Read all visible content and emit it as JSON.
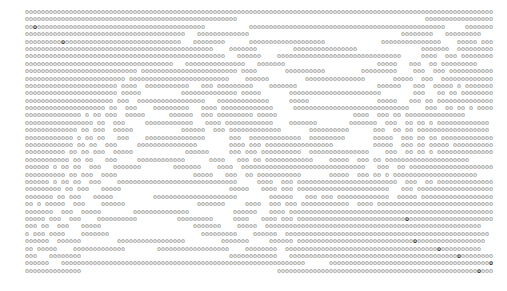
{
  "art": {
    "colors": {
      "glyph": "#7a7a7a",
      "highlight": "#1e1e1e",
      "background": "#ffffff"
    },
    "rows": [
      "ooooooooooooooooooooooooooooooooooooooooooooooooooooooooooooooooooooooooooooooooooooooooooooooooooooooooooooooooooooo",
      "ooooooooooooooooooooooooooooooooooooooooooooooooooooo                                               oooooooooooooooooooooo",
      "ooOoooooooooooooooooooooooooooooooooooooooooo           ooooooooooooooooooooooooooooooooooooooooooooooooo     ooooooooooooooo",
      "oooooooooooooooooooooooooooooooooooooooo   ooooooooooooo                                      oooooooo   ooooooooo",
      "oooooooooOooooooooooooooooooooooooooooo   oooooooo      ooooooooooooooooooo              ooooooooooooooo    ooooo oooooooo",
      "ooooooooooooooooooooooooooooooooooooooooooooooo    ooooooo         oooooooooooooooo                ooooooo  oooooooooooo",
      "ooooooooooooooooOooooooooooooooooooooooooooooooooooo     oooooooooo                    oooooooo     oooo ooo ooooooo",
      "oooooooooooooooooooooooooooooooooooooooooooooooooo   oooooo    ooooooooooooooooooooooooooooooo     oooo  ooo ooooooooo",
      "ooooooooooooooooooooooooooooooooooooo   ooooooooooooooo   ooooooo                       ooooo   ooo  oo ooooooooo",
      "oooooooooooooooooooooooooooo oooooooooooooooooooooooo oooo       oooooooooo         ooooooooo    ooo  ooo oooooooooooo",
      "ooooooooooooooooooooooooo ooooooooooooooooooooooooo    oooooo         ooooooooooooooo       ooooo  ooo  ooooooooooooo",
      "ooooooooooooooooooooooo oooo  ooooooooooo   ooo ooooooooo    ooooooo                    oooooo   ooo  ooooo o oooooooo",
      "ooooooooooooooooooooooo ooooo          oooooooooooooo ooooo       ooooooooooooooooooooooo        ooo   oo oo ooooooooooo",
      "oooooooooooooooooooooo ooo  ooooooooooooooooo   ooooooooooooo     ooooo                 ooooo   ooo oo oooooooooooooo",
      "oooooooooooooooooooo oo  ooo    ooooooooo   oooo ooooooooooooo     ooooooooooooooooooooooooooooo    ooo  oo oo o oooooooooooo",
      "oooooooooooooo o oo ooo  ooooo      oooooo  ooo ooooooooo ooooo                   oooo  ooo oo ooooooooooooooo",
      "ooooooooooooooooo oo  ooo     oooooooooooo   oooo oooooooooooo    ooooooo        ooooooo  ooo  oo oo o ooooooooooooo",
      "ooooooooooooo oo ooo  ooooo            oooooo  ooo ooooooooooooo       oooooooooo      ooo  oo oo oooooooooooooooooo",
      "oooooooooooo o oo oo   ooo    ooooooooooooooo      ooo  ooooooooooooo  ooooooooo       ooooo  ooo oo oo ooooooooooooooo",
      "oooooooo ooooo oo ooo  ooooo        oooooo   ooo   oo ooooooo      ooooooooooooooo     ooo  oo oo oooooooooooooooooo",
      "oooooooooooo oo oo  ooo     ooooooooooooooo        oooo ooo ooooooooooooooooo          ooooo  ooo oo ooooo ooooooooooooooo",
      "oooooooooo oo oo ooo  ooooo             oooooo     ooo ooo oooooooooo  ooooooooooooooo    ooo  oo oo o ooooooooooooooo",
      "ooooooooooo oo oo   ooo     oooooooooooo      oooo   ooo oo oooooooooooo    ooooo  ooo oo ooooooooooooooooooooo",
      "oooooo o oo oo  ooo   ooooooo        ooooooo    oooo  ooooooooooooooooooooooooooooooo   ooo  oo ooooooooooooooooooooooo",
      "oooooooooo oo ooo  oooo                   ooooo   ooo  oo ooooooooooo       ooooo  ooo oo o ooooooooooooooooooooo",
      "oooooo o oo oo  ooo    oooooooooooooooooooooooooooooo     oooo  ooo ooooooooooooooooooooooooo  ooo  oo ooooooooooooooooooooo",
      "ooooooooo oo ooo   ooooo                           ooooo   oooo ooo ooooooooooooooooooooooo   ooo oooooooooooooooooooooooooooo",
      "ooooooo oo ooo   ooooo          ooooooooooooooooooooo        oooooo   ooo ooo ooooooooooooo  ooooo oooooooooooooooooooooooooooo",
      "oo o ooooo  ooo    oooooo                  ooooooo     oooo  ooo ooo oooooooooooo  oooo ooooooooooooooooooooooooooooooo",
      "ooooooo  ooo  ooooo        oooooooooooooo           oooooo   oooo ooooooooooooooooooooooooooooooooooooooooooooooooooo",
      "ooooo ooo  ooo    oooooooooo          ooooooooo     oooo   oooo ooo oooooooooooooooooooooooooooOoooooooooooooooooooooo",
      "ooo oo  ooo   ooooo                       ooooooo    ooooo  oooooooooooooooooooooooooooooooooooooooooooooooooooooo",
      "oooo ooo  oooo   oooooooooooooooooooooooooooooooo       oooooo   ooooo oooooooooooooooooooooOooooooooooooooooooooooooo",
      "o ooo oooo    ooooooo                       ooooooooo    oooooo  ooooooooooooooooooooooooooooooooooooooooooooooooooo",
      "oooooo  oooooo         ooooooooooooooooo         ooooooo     oooooo oooooooooooooooooooooooooooooOooooooooooooooooo",
      "oo ooooo    ooooooooooooo        oooooooooooooooooo    oooooooo  ooooooooooooooooooooooooooooooooooooooOoooooooooo",
      "ooo   oooooooo                                     oooooooooooo   ooooooooooooooooooooooooooooooooooooooooooOoooooooo",
      "oooooo   ooooooooooooooooooooooooooooooooooooooooooooooooooooooooooooo      ooooooooooooooooooooooooooooooooooooooooOoooo",
      "oooooooooooooo                                                 ooooooooooooooooooooooooooooooooooooooooooooooooooOooo"
    ]
  }
}
